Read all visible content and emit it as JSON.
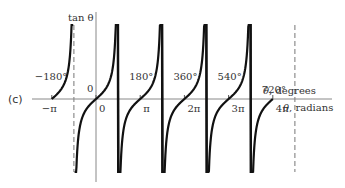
{
  "chart_data": {
    "type": "line",
    "title": "",
    "panel_label": "(c)",
    "ylabel": "tan θ",
    "xlabel_degrees": "θ, degrees",
    "xlabel_radians": "θ, radians",
    "x_ticks_degrees": [
      "−180°",
      "0",
      "180°",
      "360°",
      "540°",
      "720°"
    ],
    "x_ticks_radians": [
      "−π",
      "0",
      "π",
      "2π",
      "3π",
      "4π"
    ],
    "x_range_radians": [
      -3.6,
      12.6
    ],
    "asymptotes_radians": [
      -1.5708,
      1.5708,
      4.7124,
      7.854,
      10.9956,
      14.137
    ],
    "asymptote_labels": [
      "−π/2",
      "π/2",
      "3π/2",
      "5π/2",
      "7π/2",
      "9π/2"
    ],
    "series": [
      {
        "name": "tan θ",
        "function": "tan(x)",
        "branches": [
          {
            "x_from": -3.14159,
            "x_to": -1.62
          },
          {
            "x_from": -1.52,
            "x_to": 1.62
          },
          {
            "x_from": 1.52,
            "x_to": 4.76
          },
          {
            "x_from": 4.66,
            "x_to": 7.9
          },
          {
            "x_from": 7.81,
            "x_to": 11.04
          },
          {
            "x_from": 10.95,
            "x_to": 12.566
          }
        ]
      }
    ],
    "grid": false,
    "legend": null
  }
}
